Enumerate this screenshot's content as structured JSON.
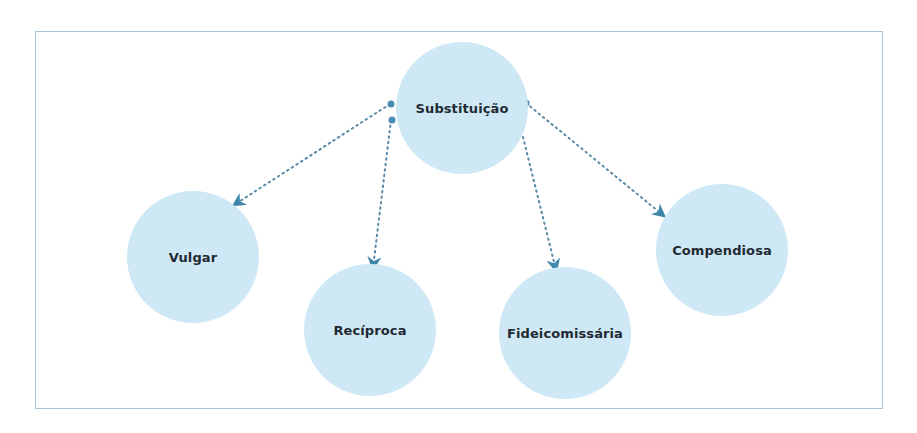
{
  "diagram": {
    "type": "hierarchy",
    "root": {
      "label": "Substituição",
      "cx": 462,
      "cy": 108,
      "r": 66
    },
    "children": [
      {
        "label": "Vulgar",
        "cx": 193,
        "cy": 257,
        "r": 66
      },
      {
        "label": "Recíproca",
        "cx": 370,
        "cy": 330,
        "r": 66
      },
      {
        "label": "Fideicomissária",
        "cx": 565,
        "cy": 333,
        "r": 66
      },
      {
        "label": "Compendiosa",
        "cx": 722,
        "cy": 250,
        "r": 66
      }
    ],
    "edges": [
      {
        "from": "Substituição",
        "to": "Vulgar",
        "style": "dotted-arrow"
      },
      {
        "from": "Substituição",
        "to": "Recíproca",
        "style": "dotted-arrow"
      },
      {
        "from": "Substituição",
        "to": "Fideicomissária",
        "style": "dotted-arrow"
      },
      {
        "from": "Substituição",
        "to": "Compendiosa",
        "style": "dotted-arrow"
      }
    ],
    "colors": {
      "node_fill": "#cfe8f5",
      "frame_border": "#a9c6d8",
      "edge": "#5a8aa6",
      "arrow_head": "#3f86ab",
      "dot": "#4a8db3",
      "text": "#1f2a33"
    }
  }
}
